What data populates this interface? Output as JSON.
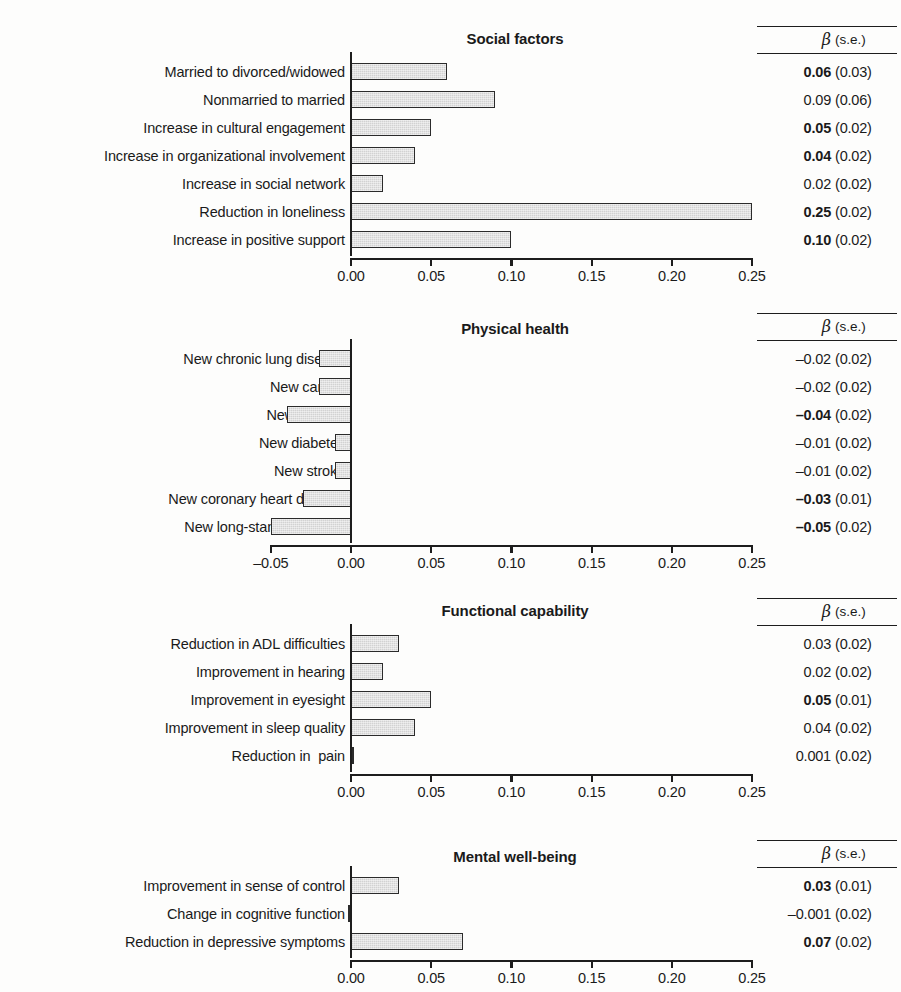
{
  "chart_data": {
    "type": "bar",
    "title": "",
    "orientation": "horizontal",
    "xlabel": "",
    "ylabel": "",
    "grid": false,
    "legend": null,
    "stats_columns": {
      "beta": "β",
      "se": "(s.e.)"
    },
    "panels": [
      {
        "title": "Social factors",
        "xlim": [
          0.0,
          0.25
        ],
        "xticks": [
          "0.00",
          "0.05",
          "0.10",
          "0.15",
          "0.20",
          "0.25"
        ],
        "xtick_values": [
          0.0,
          0.05,
          0.1,
          0.15,
          0.2,
          0.25
        ],
        "categories": [
          "Married to divorced/widowed",
          "Nonmarried to married",
          "Increase in cultural engagement",
          "Increase in organizational involvement",
          "Increase in social network",
          "Reduction in loneliness",
          "Increase in positive support"
        ],
        "values": [
          0.06,
          0.09,
          0.05,
          0.04,
          0.02,
          0.25,
          0.1
        ],
        "beta_labels": [
          "0.06",
          "0.09",
          "0.05",
          "0.04",
          "0.02",
          "0.25",
          "0.10"
        ],
        "se_labels": [
          "(0.03)",
          "(0.06)",
          "(0.02)",
          "(0.02)",
          "(0.02)",
          "(0.02)",
          "(0.02)"
        ],
        "significant": [
          true,
          false,
          true,
          true,
          false,
          true,
          true
        ]
      },
      {
        "title": "Physical health",
        "xlim": [
          -0.05,
          0.25
        ],
        "xticks": [
          "–0.05",
          "0.00",
          "0.05",
          "0.10",
          "0.15",
          "0.20",
          "0.25"
        ],
        "xtick_values": [
          -0.05,
          0.0,
          0.05,
          0.1,
          0.15,
          0.2,
          0.25
        ],
        "categories": [
          "New chronic lung disease",
          "New cancer",
          "New arthritis",
          "New diabetes",
          "New stroke",
          "New coronary heart disease",
          "New long-standing illness"
        ],
        "values": [
          -0.02,
          -0.02,
          -0.04,
          -0.01,
          -0.01,
          -0.03,
          -0.05
        ],
        "beta_labels": [
          "–0.02",
          "–0.02",
          "–0.04",
          "–0.01",
          "–0.01",
          "–0.03",
          "–0.05"
        ],
        "se_labels": [
          "(0.02)",
          "(0.02)",
          "(0.02)",
          "(0.02)",
          "(0.02)",
          "(0.01)",
          "(0.02)"
        ],
        "significant": [
          false,
          false,
          true,
          false,
          false,
          true,
          true
        ]
      },
      {
        "title": "Functional capability",
        "xlim": [
          0.0,
          0.25
        ],
        "xticks": [
          "0.00",
          "0.05",
          "0.10",
          "0.15",
          "0.20",
          "0.25"
        ],
        "xtick_values": [
          0.0,
          0.05,
          0.1,
          0.15,
          0.2,
          0.25
        ],
        "categories": [
          "Reduction in ADL difficulties",
          "Improvement in hearing",
          "Improvement in eyesight",
          "Improvement in sleep quality",
          "Reduction in  pain"
        ],
        "values": [
          0.03,
          0.02,
          0.05,
          0.04,
          0.001
        ],
        "beta_labels": [
          "0.03",
          "0.02",
          "0.05",
          "0.04",
          "0.001"
        ],
        "se_labels": [
          "(0.02)",
          "(0.02)",
          "(0.01)",
          "(0.02)",
          "(0.02)"
        ],
        "significant": [
          false,
          false,
          true,
          false,
          false
        ]
      },
      {
        "title": "Mental well-being",
        "xlim": [
          0.0,
          0.25
        ],
        "xticks": [
          "0.00",
          "0.05",
          "0.10",
          "0.15",
          "0.20",
          "0.25"
        ],
        "xtick_values": [
          0.0,
          0.05,
          0.1,
          0.15,
          0.2,
          0.25
        ],
        "categories": [
          "Improvement in sense of control",
          "Change in cognitive function",
          "Reduction in depressive symptoms"
        ],
        "values": [
          0.03,
          -0.001,
          0.07
        ],
        "beta_labels": [
          "0.03",
          "–0.001",
          "0.07"
        ],
        "se_labels": [
          "(0.01)",
          "(0.02)",
          "(0.02)"
        ],
        "significant": [
          true,
          false,
          true
        ]
      }
    ]
  },
  "style": {
    "bar_fill": "#d2d2d2",
    "bar_border": "#2b2b2b",
    "axis_color": "#1d1d1d",
    "text_color": "#1a1a1a",
    "background": "#fdfdfc"
  }
}
